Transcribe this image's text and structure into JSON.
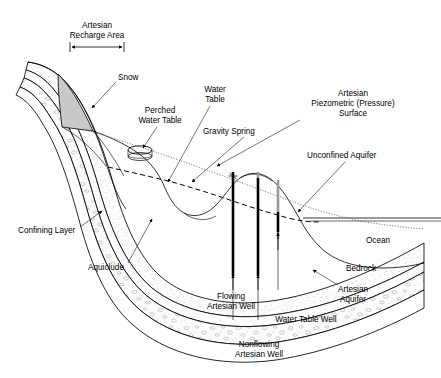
{
  "figure": {
    "width": 441,
    "height": 378,
    "background_color": "#ffffff",
    "line_color": "#000000"
  },
  "labels": {
    "recharge_area_line1": "Artesian",
    "recharge_area_line2": "Recharge Area",
    "snow": "Snow",
    "perched_line1": "Perched",
    "perched_line2": "Water Table",
    "water_table_line1": "Water",
    "water_table_line2": "Table",
    "gravity_spring": "Gravity Spring",
    "piezometric_line1": "Artesian",
    "piezometric_line2": "Piezometric (Pressure)",
    "piezometric_line3": "Surface",
    "unconfined_aquifer": "Unconfined Aquifer",
    "confining_layer": "Confining Layer",
    "aquiclude": "Aquiclude",
    "ocean": "Ocean",
    "bedrock": "Bedrock",
    "artesian_aquifer_line1": "Artesian",
    "artesian_aquifer_line2": "Aquifer",
    "flowing_well_line1": "Flowing",
    "flowing_well_line2": "Artesian Well",
    "water_table_well": "Water Table Well",
    "nonflowing_well_line1": "Nonflowing",
    "nonflowing_well_line2": "Artesian Well"
  },
  "features": {
    "snow_fill": "#c9c9c9",
    "stipple_fill": "#fbfbfb",
    "well_casing_color": "#9a9a9a",
    "well_water_color": "#000000",
    "ocean_surface_label": "Ocean",
    "well_count": 3,
    "wells": [
      {
        "name": "Flowing Artesian Well",
        "x": 233,
        "filled": true
      },
      {
        "name": "Nonflowing Artesian Well",
        "x": 258,
        "filled": true
      },
      {
        "name": "Water Table Well",
        "x": 278,
        "filled": false
      }
    ]
  }
}
